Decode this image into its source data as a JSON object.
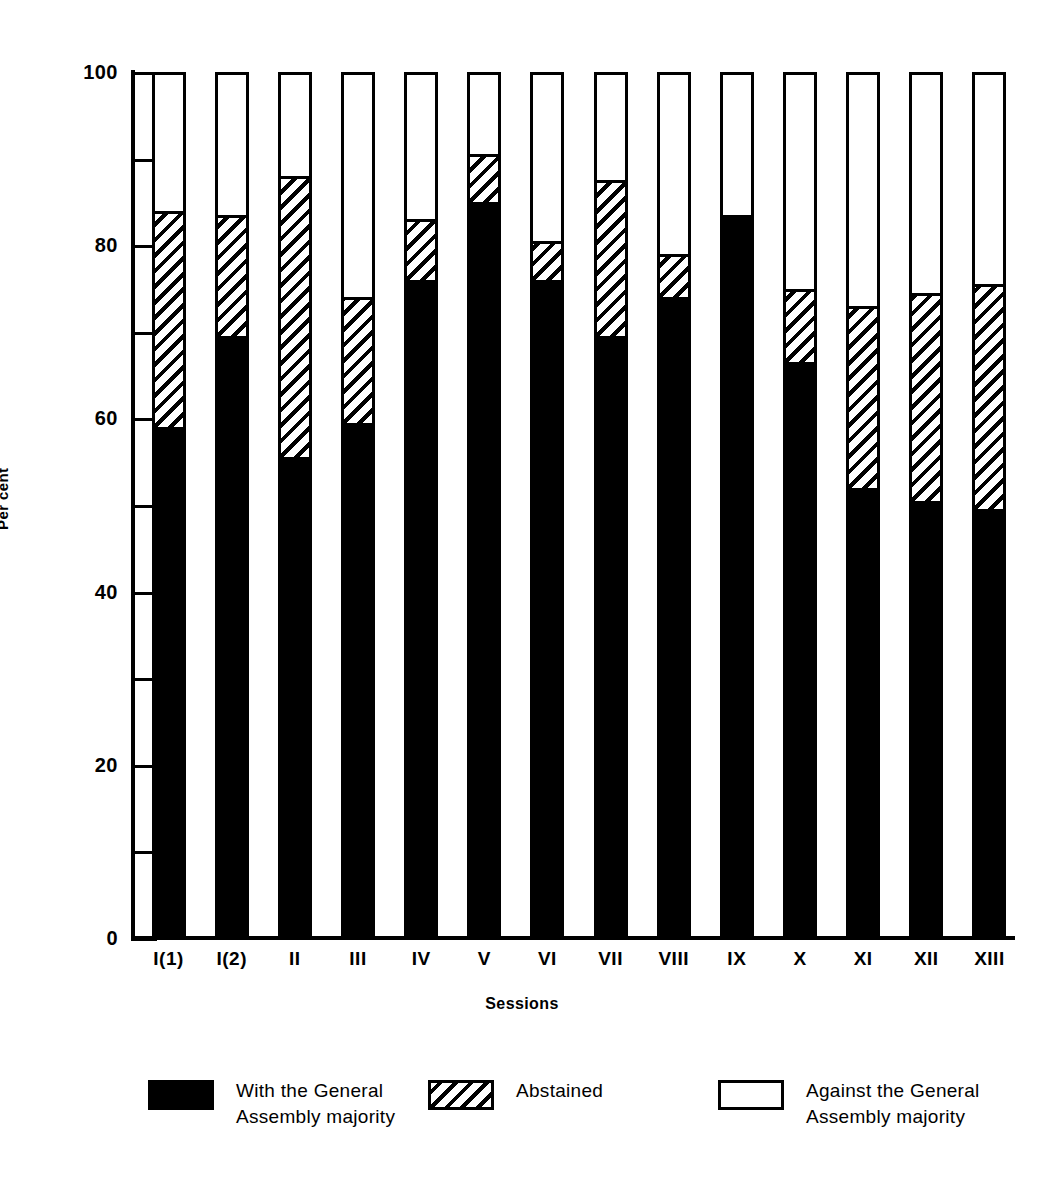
{
  "chart_data": {
    "type": "bar",
    "subtype": "stacked-percent",
    "title": "",
    "xlabel": "Sessions",
    "ylabel": "Per cent",
    "ylim": [
      0,
      100
    ],
    "yticks": [
      0,
      20,
      40,
      60,
      80,
      100
    ],
    "ytick_labels": [
      "0",
      "20",
      "40",
      "60",
      "80",
      "100"
    ],
    "yminorticks": [
      10,
      30,
      50,
      70,
      90
    ],
    "grid": false,
    "legend_position": "bottom",
    "categories": [
      "I(1)",
      "I(2)",
      "II",
      "III",
      "IV",
      "V",
      "VI",
      "VII",
      "VIII",
      "IX",
      "X",
      "XI",
      "XII",
      "XIII"
    ],
    "series": [
      {
        "name": "With the General Assembly majority",
        "pattern": "solid-black",
        "color": "#000000",
        "values": [
          59,
          69.5,
          55.5,
          59.5,
          76,
          85,
          76,
          69.5,
          74,
          83.5,
          66.5,
          52,
          50.5,
          49.5
        ]
      },
      {
        "name": "Abstained",
        "pattern": "diagonal-hatch",
        "color": "#ffffff",
        "values": [
          25,
          14,
          32.5,
          14.5,
          7,
          5.5,
          4.5,
          18,
          5,
          0,
          8.5,
          21,
          24,
          26
        ]
      },
      {
        "name": "Against the General Assembly majority",
        "pattern": "white",
        "color": "#ffffff",
        "values": [
          16,
          16.5,
          12,
          26,
          17,
          9.5,
          19.5,
          12.5,
          21,
          16.5,
          25,
          27,
          25.5,
          24.5
        ]
      }
    ],
    "cumulative_tops": {
      "with": [
        59,
        69.5,
        55.5,
        59.5,
        76,
        85,
        76,
        69.5,
        74,
        83.5,
        66.5,
        52,
        50.5,
        49.5
      ],
      "with_plus_abstained": [
        84,
        83.5,
        88,
        74,
        83,
        90.5,
        80.5,
        87.5,
        79,
        83.5,
        75,
        73,
        74.5,
        75.5
      ]
    }
  },
  "axes": {
    "y_title": "Per cent",
    "x_title": "Sessions"
  },
  "legend": {
    "items": [
      {
        "id": "legend-with",
        "swatch": "solid-black",
        "label": "With the General\nAssembly majority"
      },
      {
        "id": "legend-abstained",
        "swatch": "diagonal-hatch",
        "label": "Abstained"
      },
      {
        "id": "legend-against",
        "swatch": "white-outline",
        "label": "Against the General\nAssembly majority"
      }
    ]
  },
  "colors": {
    "ink": "#000000",
    "paper": "#ffffff"
  }
}
